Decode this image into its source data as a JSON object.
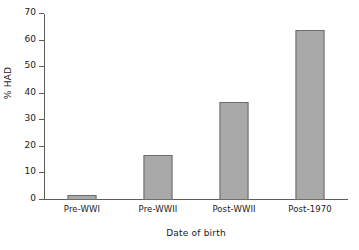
{
  "chart_data": {
    "type": "bar",
    "title": "",
    "categories": [
      "Pre-WWI",
      "Pre-WWII",
      "Post-WWII",
      "Post-1970"
    ],
    "values": [
      2,
      17,
      37,
      64
    ],
    "series": [
      {
        "name": "% HAD",
        "values": [
          2,
          17,
          37,
          64
        ]
      }
    ],
    "xlabel": "Date of birth",
    "ylabel": "% HAD",
    "ylim": [
      0,
      70
    ],
    "yticks": [
      0,
      10,
      20,
      30,
      40,
      50,
      60,
      70
    ],
    "ytick_labels": [
      "0",
      "10",
      "20",
      "30",
      "40",
      "50",
      "60",
      "70"
    ],
    "grid": false,
    "legend": false,
    "bar_color": "#a9a9a9",
    "bar_border_color": "#6d6d6d",
    "axis_color": "#5c5c5c"
  }
}
